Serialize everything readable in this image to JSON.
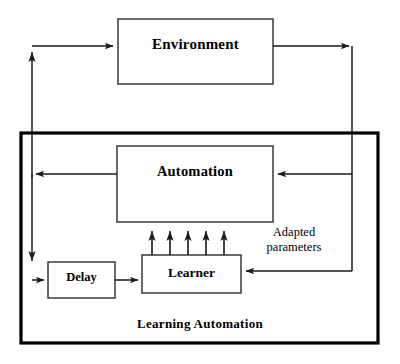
{
  "diagram": {
    "title": "Learning Automation",
    "outer_container": {
      "label": "Learning Automation",
      "name": "learning-automation-boundary"
    },
    "nodes": [
      {
        "id": "environment",
        "label": "Environment"
      },
      {
        "id": "automation",
        "label": "Automation"
      },
      {
        "id": "delay",
        "label": "Delay"
      },
      {
        "id": "learner",
        "label": "Learner"
      }
    ],
    "annotations": [
      {
        "id": "adapted-parameters",
        "line1": "Adapted",
        "line2": "parameters"
      }
    ],
    "edges": [
      {
        "from": "automation",
        "to": "environment",
        "note": "left feedback path up into Environment"
      },
      {
        "from": "environment",
        "to": "automation",
        "note": "right path down into Automation"
      },
      {
        "from": "environment",
        "to": "learner",
        "note": "right path down into Learner"
      },
      {
        "from": "automation",
        "to": "delay",
        "note": "left path down into Delay"
      },
      {
        "from": "delay",
        "to": "learner",
        "note": "Delay feeds Learner"
      },
      {
        "from": "learner",
        "to": "automation",
        "note": "five adapted parameter arrows"
      }
    ],
    "colors": {
      "stroke": "#1a1a1a",
      "boundary_stroke": "#000000",
      "background": "#ffffff",
      "text": "#000000"
    }
  }
}
